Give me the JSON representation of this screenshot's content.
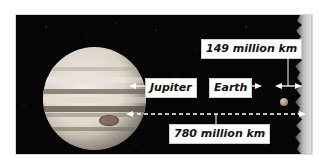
{
  "diagram": {
    "background_color": "#050505",
    "labels": {
      "jupiter": "Jupiter",
      "earth": "Earth",
      "earth_distance": "149 million km",
      "jupiter_distance": "780 million km"
    },
    "objects": [
      {
        "name": "Jupiter",
        "description": "banded gas giant with Great Red Spot"
      },
      {
        "name": "Earth",
        "description": "small planet"
      },
      {
        "name": "Sun",
        "description": "glowing edge at right side"
      }
    ],
    "distances": [
      {
        "from": "Earth",
        "to": "Sun",
        "value": "149 million km"
      },
      {
        "from": "Jupiter",
        "to": "Sun",
        "value": "780 million km"
      }
    ]
  }
}
